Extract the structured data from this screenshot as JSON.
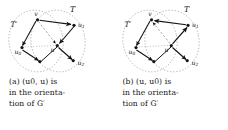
{
  "figure": {
    "type": "two-panel-graph-diagram",
    "background": "#ffffff",
    "ink_color": "#141414",
    "dotted_color": "#9a9a9a",
    "dashed_color": "#8d8d8d",
    "subfigures": [
      {
        "id": "a",
        "tag": "(a)",
        "caption_lines": [
          "(a)   (u0, u)  is",
          "in the orienta-",
          "tion of G′"
        ],
        "caption_text": "(a) (u0, u) is in the orientation of G′",
        "region_labels": [
          {
            "name": "T-prime-label",
            "text": "T′",
            "x": 14,
            "y": 25
          },
          {
            "name": "T-label",
            "text": "T",
            "x": 73,
            "y": 9
          }
        ],
        "vertices": [
          {
            "name": "v",
            "label": "v",
            "x": 37,
            "y": 19,
            "label_dx": -1,
            "label_dy": -4
          },
          {
            "name": "u1",
            "label": "u1",
            "x": 74,
            "y": 25,
            "label_dx": 6,
            "label_dy": 1
          },
          {
            "name": "u0",
            "label": "u0",
            "x": 21,
            "y": 48,
            "label_dx": -2,
            "label_dy": 5
          },
          {
            "name": "u",
            "label": "u",
            "x": 57,
            "y": 46,
            "label_dx": -5,
            "label_dy": 5
          },
          {
            "name": "b",
            "label": "",
            "x": 40,
            "y": 62,
            "label_dx": 0,
            "label_dy": 0
          },
          {
            "name": "u2",
            "label": "u2",
            "x": 74,
            "y": 61,
            "label_dx": 6,
            "label_dy": 3
          }
        ],
        "edges": [
          {
            "name": "v-to-u1",
            "from": "v",
            "to": "u1",
            "style": "solid",
            "arrow": "to"
          },
          {
            "name": "u1-to-u",
            "from": "u1",
            "to": "u",
            "style": "solid",
            "arrow": "to"
          },
          {
            "name": "v-to-u0",
            "from": "v",
            "to": "u0",
            "style": "solid",
            "arrow": "to-from"
          },
          {
            "name": "u0-to-b",
            "from": "u0",
            "to": "b",
            "style": "solid",
            "arrow": "to"
          },
          {
            "name": "b-to-u",
            "from": "b",
            "to": "u",
            "style": "solid",
            "arrow": "none"
          },
          {
            "name": "u-to-u2",
            "from": "u",
            "to": "u2",
            "style": "solid",
            "arrow": "to"
          },
          {
            "name": "v-to-u-dashed",
            "from": "v",
            "to": "u",
            "style": "dashed",
            "arrow": "to"
          },
          {
            "name": "u0-to-u-dotted",
            "from": "u0",
            "to": "u",
            "style": "dotted",
            "arrow": "none"
          }
        ]
      },
      {
        "id": "b",
        "tag": "(b)",
        "caption_lines": [
          "(b)   (u, u0)  is",
          "in the orienta-",
          "tion of G′"
        ],
        "caption_text": "(b) (u, u0) is in the orientation of G′",
        "region_labels": [
          {
            "name": "T-prime-label",
            "text": "T′",
            "x": 14,
            "y": 25
          },
          {
            "name": "T-label",
            "text": "T",
            "x": 73,
            "y": 9
          }
        ],
        "vertices": [
          {
            "name": "v",
            "label": "v",
            "x": 37,
            "y": 19,
            "label_dx": -1,
            "label_dy": -4
          },
          {
            "name": "u1",
            "label": "u1",
            "x": 74,
            "y": 25,
            "label_dx": 6,
            "label_dy": 1
          },
          {
            "name": "u0",
            "label": "u0",
            "x": 21,
            "y": 48,
            "label_dx": -2,
            "label_dy": 5
          },
          {
            "name": "u",
            "label": "u",
            "x": 57,
            "y": 46,
            "label_dx": -5,
            "label_dy": 5
          },
          {
            "name": "b",
            "label": "",
            "x": 40,
            "y": 62,
            "label_dx": 0,
            "label_dy": 0
          },
          {
            "name": "u2",
            "label": "u2",
            "x": 74,
            "y": 61,
            "label_dx": 6,
            "label_dy": 3
          }
        ],
        "edges": [
          {
            "name": "u1-to-v",
            "from": "u1",
            "to": "v",
            "style": "solid",
            "arrow": "to"
          },
          {
            "name": "u-to-u1",
            "from": "u",
            "to": "u1",
            "style": "solid",
            "arrow": "to"
          },
          {
            "name": "v-to-u0",
            "from": "v",
            "to": "u0",
            "style": "solid",
            "arrow": "to"
          },
          {
            "name": "u0-to-b",
            "from": "u0",
            "to": "b",
            "style": "solid",
            "arrow": "to"
          },
          {
            "name": "b-to-u",
            "from": "b",
            "to": "u",
            "style": "solid",
            "arrow": "none"
          },
          {
            "name": "u-to-u2",
            "from": "u",
            "to": "u2",
            "style": "solid",
            "arrow": "to"
          },
          {
            "name": "u-to-v-dashed",
            "from": "u",
            "to": "v",
            "style": "dashed",
            "arrow": "to"
          },
          {
            "name": "u0-to-u-dotted",
            "from": "u0",
            "to": "u",
            "style": "dotted",
            "arrow": "none"
          }
        ]
      }
    ],
    "ellipses": [
      {
        "name": "ellipse-T-prime",
        "cx": 36,
        "cy": 41,
        "rx": 27,
        "ry": 31,
        "rotate": -12
      },
      {
        "name": "ellipse-T",
        "cx": 58,
        "cy": 41,
        "rx": 27,
        "ry": 31,
        "rotate": -12
      }
    ]
  }
}
